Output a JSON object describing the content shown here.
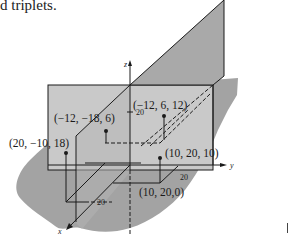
{
  "caption": {
    "text": "d triplets."
  },
  "figure": {
    "axes": {
      "x_label": "x",
      "y_label": "y",
      "z_label": "z",
      "tick_z": "20",
      "tick_y": "20",
      "tick_x": "20"
    },
    "points": [
      {
        "label": "(−12, −18, 6)",
        "coords": [
          -12,
          -18,
          6
        ]
      },
      {
        "label": "(−12, 6, 12)",
        "coords": [
          -12,
          6,
          12
        ]
      },
      {
        "label": "(20, −10, 18)",
        "coords": [
          20,
          -10,
          18
        ]
      },
      {
        "label": "(10, 20, 10)",
        "coords": [
          10,
          20,
          10
        ]
      },
      {
        "label": "(10, 20,0)",
        "coords": [
          10,
          20,
          0
        ]
      }
    ],
    "colors": {
      "vertical_plane": "#c9c9c9",
      "tilted_plane": "#a9a9a9",
      "ground": "#a3a3a3",
      "line": "#1a1a1a"
    }
  }
}
